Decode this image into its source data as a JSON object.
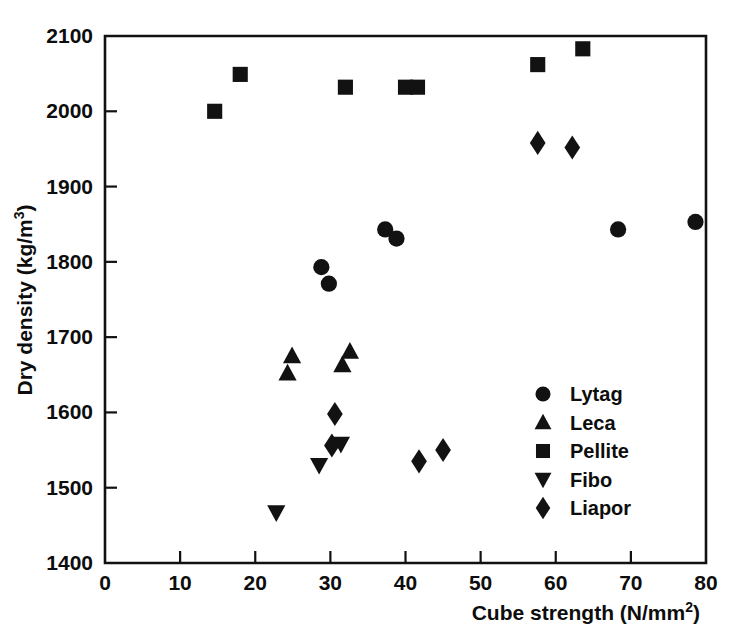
{
  "chart_data": {
    "type": "scatter",
    "title": "",
    "xlabel": "Cube strength (N/mm2)",
    "xlabel_base": "Cube strength (N/mm",
    "xlabel_sup": "2",
    "xlabel_close": ")",
    "ylabel": "Dry density (kg/m3)",
    "ylabel_base": "Dry density (kg/m",
    "ylabel_sup": "3",
    "ylabel_close": ")",
    "xlim": [
      0,
      80
    ],
    "ylim": [
      1400,
      2100
    ],
    "xticks": [
      0,
      10,
      20,
      30,
      40,
      50,
      60,
      70,
      80
    ],
    "yticks": [
      1400,
      1500,
      1600,
      1700,
      1800,
      1900,
      2000,
      2100
    ],
    "xticklabels": [
      "0",
      "10",
      "20",
      "30",
      "40",
      "50",
      "60",
      "70",
      "80"
    ],
    "yticklabels": [
      "1400",
      "1500",
      "1600",
      "1700",
      "1800",
      "1900",
      "2000",
      "2100"
    ],
    "grid": false,
    "legend_position": "center-right",
    "marker_color": "#121212",
    "series": [
      {
        "name": "Lytag",
        "marker": "circle",
        "points": [
          {
            "x": 28.8,
            "y": 1793
          },
          {
            "x": 29.8,
            "y": 1771
          },
          {
            "x": 37.3,
            "y": 1843
          },
          {
            "x": 38.8,
            "y": 1831
          },
          {
            "x": 68.3,
            "y": 1843
          },
          {
            "x": 78.6,
            "y": 1853
          }
        ]
      },
      {
        "name": "Leca",
        "marker": "triangle-up",
        "points": [
          {
            "x": 24.9,
            "y": 1675
          },
          {
            "x": 24.3,
            "y": 1652
          },
          {
            "x": 32.6,
            "y": 1681
          },
          {
            "x": 31.6,
            "y": 1663
          }
        ]
      },
      {
        "name": "Pellite",
        "marker": "square",
        "points": [
          {
            "x": 14.6,
            "y": 2000
          },
          {
            "x": 18.0,
            "y": 2049
          },
          {
            "x": 32.0,
            "y": 2032
          },
          {
            "x": 40.0,
            "y": 2032
          },
          {
            "x": 41.6,
            "y": 2032
          },
          {
            "x": 57.6,
            "y": 2062
          },
          {
            "x": 63.6,
            "y": 2083
          }
        ]
      },
      {
        "name": "Fibo",
        "marker": "triangle-down",
        "points": [
          {
            "x": 22.8,
            "y": 1467
          },
          {
            "x": 28.5,
            "y": 1530
          },
          {
            "x": 31.4,
            "y": 1558
          }
        ]
      },
      {
        "name": "Liapor",
        "marker": "diamond",
        "points": [
          {
            "x": 30.6,
            "y": 1598
          },
          {
            "x": 30.2,
            "y": 1556
          },
          {
            "x": 41.8,
            "y": 1535
          },
          {
            "x": 45.0,
            "y": 1550
          },
          {
            "x": 57.6,
            "y": 1958
          },
          {
            "x": 62.2,
            "y": 1952
          }
        ]
      }
    ],
    "legend": [
      {
        "label": "Lytag",
        "marker": "circle"
      },
      {
        "label": "Leca",
        "marker": "triangle-up"
      },
      {
        "label": "Pellite",
        "marker": "square"
      },
      {
        "label": "Fibo",
        "marker": "triangle-down"
      },
      {
        "label": "Liapor",
        "marker": "diamond"
      }
    ]
  }
}
